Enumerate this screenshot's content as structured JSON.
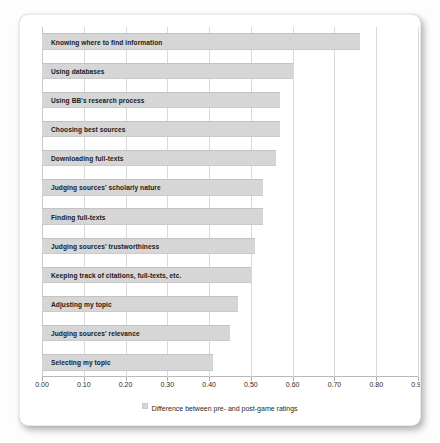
{
  "chart_data": {
    "type": "bar",
    "orientation": "horizontal",
    "title": "",
    "xlabel": "",
    "ylabel": "",
    "xlim": [
      0.0,
      0.9
    ],
    "grid": true,
    "legend_position": "bottom",
    "legend": [
      "Difference between pre- and post-game ratings"
    ],
    "xticks": [
      "0.00",
      "0.10",
      "0.20",
      "0.30",
      "0.40",
      "0.50",
      "0.60",
      "0.70",
      "0.80",
      "0.90"
    ],
    "xtick_values": [
      0.0,
      0.1,
      0.2,
      0.3,
      0.4,
      0.5,
      0.6,
      0.7,
      0.8,
      0.9
    ],
    "bar_color": "#d6d6d6",
    "categories": [
      "Knowing where to find information",
      "Using databases",
      "Using BB's research process",
      "Choosing best sources",
      "Downloading full-texts",
      "Judging sources' scholarly nature",
      "Finding full-texts",
      "Judging sources' trustworthiness",
      "Keeping track of citations, full-texts, etc.",
      "Adjusting my topic",
      "Judging sources' relevance",
      "Selecting my topic"
    ],
    "values": [
      0.76,
      0.6,
      0.57,
      0.57,
      0.56,
      0.53,
      0.53,
      0.51,
      0.5,
      0.47,
      0.45,
      0.41
    ],
    "series": [
      {
        "name": "Difference between pre- and post-game ratings",
        "values": [
          0.76,
          0.6,
          0.57,
          0.57,
          0.56,
          0.53,
          0.53,
          0.51,
          0.5,
          0.47,
          0.45,
          0.41
        ]
      }
    ]
  }
}
